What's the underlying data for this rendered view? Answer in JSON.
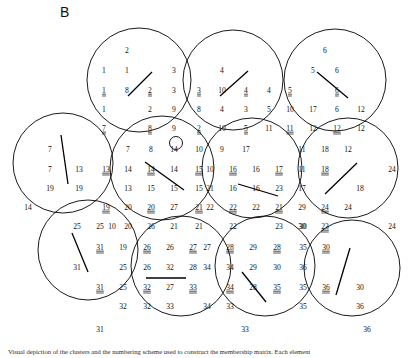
{
  "figure": {
    "panel_label": "B",
    "caption": "Visual depiction of the clusters and the numbering scheme used to construct the membership matrix. Each element",
    "stroke_color": "#000000",
    "background_color": "#ffffff"
  },
  "chart_data": {
    "type": "diagram",
    "title": "B",
    "grid_on": false,
    "legend": "none",
    "circles": [
      {
        "id": "c1",
        "cx": 139,
        "cy": 80,
        "r": 52,
        "segment": {
          "x1": 128,
          "y1": 96,
          "x2": 152,
          "y2": 72
        }
      },
      {
        "id": "c2",
        "cx": 233,
        "cy": 80,
        "r": 50,
        "segment": {
          "x1": 220,
          "y1": 96,
          "x2": 248,
          "y2": 71
        }
      },
      {
        "id": "c3",
        "cx": 335,
        "cy": 80,
        "r": 51,
        "segment": {
          "x1": 317,
          "y1": 72,
          "x2": 348,
          "y2": 98
        }
      },
      {
        "id": "c4",
        "cx": 63,
        "cy": 163,
        "r": 50,
        "segment": {
          "x1": 61,
          "y1": 135,
          "x2": 68,
          "y2": 184
        }
      },
      {
        "id": "c5",
        "cx": 162,
        "cy": 168,
        "r": 52,
        "segment": {
          "x1": 145,
          "y1": 162,
          "x2": 184,
          "y2": 190
        }
      },
      {
        "id": "c6",
        "cx": 252,
        "cy": 168,
        "r": 50,
        "segment": {
          "x1": 238,
          "y1": 184,
          "x2": 278,
          "y2": 196
        }
      },
      {
        "id": "c7",
        "cx": 348,
        "cy": 168,
        "r": 50,
        "segment": {
          "x1": 325,
          "y1": 194,
          "x2": 357,
          "y2": 163
        }
      },
      {
        "id": "c8",
        "cx": 88,
        "cy": 250,
        "r": 50,
        "segment": {
          "x1": 72,
          "y1": 233,
          "x2": 88,
          "y2": 272
        }
      },
      {
        "id": "c9",
        "cx": 181,
        "cy": 266,
        "r": 50,
        "segment": {
          "x1": 146,
          "y1": 278,
          "x2": 186,
          "y2": 278
        }
      },
      {
        "id": "c10",
        "cx": 265,
        "cy": 266,
        "r": 50,
        "segment": {
          "x1": 242,
          "y1": 272,
          "x2": 266,
          "y2": 302
        }
      },
      {
        "id": "c11",
        "cx": 352,
        "cy": 268,
        "r": 48,
        "segment": {
          "x1": 336,
          "y1": 295,
          "x2": 350,
          "y2": 248
        }
      }
    ],
    "marker": {
      "label": "9",
      "cx": 176,
      "cy": 143,
      "r": 6.5
    },
    "labels": [
      {
        "t": "2",
        "x": 127,
        "y": 51,
        "u": false
      },
      {
        "t": "1",
        "x": 104,
        "y": 71,
        "u": false
      },
      {
        "t": "1",
        "x": 127,
        "y": 71,
        "u": false
      },
      {
        "t": "3",
        "x": 174,
        "y": 71,
        "u": false
      },
      {
        "t": "1",
        "x": 104,
        "y": 91,
        "u": true
      },
      {
        "t": "8",
        "x": 127,
        "y": 91,
        "u": false
      },
      {
        "t": "2",
        "x": 150,
        "y": 91,
        "u": true
      },
      {
        "t": "3",
        "x": 174,
        "y": 91,
        "u": false
      },
      {
        "t": "1",
        "x": 104,
        "y": 110,
        "u": false
      },
      {
        "t": "2",
        "x": 150,
        "y": 110,
        "u": false
      },
      {
        "t": "9",
        "x": 174,
        "y": 110,
        "u": false
      },
      {
        "t": "7",
        "x": 104,
        "y": 129,
        "u": true
      },
      {
        "t": "8",
        "x": 150,
        "y": 129,
        "u": true
      },
      {
        "t": "9",
        "x": 174,
        "y": 129,
        "u": false
      },
      {
        "t": "4",
        "x": 222,
        "y": 71,
        "u": false
      },
      {
        "t": "3",
        "x": 199,
        "y": 91,
        "u": true
      },
      {
        "t": "10",
        "x": 222,
        "y": 91,
        "u": false
      },
      {
        "t": "4",
        "x": 246,
        "y": 91,
        "u": true
      },
      {
        "t": "4",
        "x": 269,
        "y": 91,
        "u": false
      },
      {
        "t": "8",
        "x": 199,
        "y": 110,
        "u": false
      },
      {
        "t": "4",
        "x": 222,
        "y": 110,
        "u": false
      },
      {
        "t": "3",
        "x": 246,
        "y": 110,
        "u": false
      },
      {
        "t": "5",
        "x": 269,
        "y": 110,
        "u": false
      },
      {
        "t": "2",
        "x": 199,
        "y": 129,
        "u": true
      },
      {
        "t": "10",
        "x": 222,
        "y": 129,
        "u": false
      },
      {
        "t": "5",
        "x": 246,
        "y": 129,
        "u": true
      },
      {
        "t": "11",
        "x": 269,
        "y": 129,
        "u": false
      },
      {
        "t": "6",
        "x": 325,
        "y": 51,
        "u": false
      },
      {
        "t": "5",
        "x": 313,
        "y": 71,
        "u": false
      },
      {
        "t": "6",
        "x": 337,
        "y": 71,
        "u": false
      },
      {
        "t": "5",
        "x": 290,
        "y": 91,
        "u": true
      },
      {
        "t": "6",
        "x": 337,
        "y": 91,
        "u": true
      },
      {
        "t": "10",
        "x": 290,
        "y": 110,
        "u": false
      },
      {
        "t": "17",
        "x": 313,
        "y": 110,
        "u": false
      },
      {
        "t": "6",
        "x": 337,
        "y": 110,
        "u": false
      },
      {
        "t": "12",
        "x": 361,
        "y": 110,
        "u": false
      },
      {
        "t": "11",
        "x": 290,
        "y": 129,
        "u": true
      },
      {
        "t": "12",
        "x": 313,
        "y": 129,
        "u": false
      },
      {
        "t": "12",
        "x": 337,
        "y": 129,
        "u": true
      },
      {
        "t": "12",
        "x": 361,
        "y": 129,
        "u": false
      },
      {
        "t": "7",
        "x": 50,
        "y": 150,
        "u": false
      },
      {
        "t": "7",
        "x": 50,
        "y": 170,
        "u": false
      },
      {
        "t": "13",
        "x": 79,
        "y": 170,
        "u": false
      },
      {
        "t": "19",
        "x": 50,
        "y": 189,
        "u": false
      },
      {
        "t": "19",
        "x": 79,
        "y": 189,
        "u": false
      },
      {
        "t": "14",
        "x": 28,
        "y": 208,
        "u": false
      },
      {
        "t": "19",
        "x": 106,
        "y": 208,
        "u": true
      },
      {
        "t": "13",
        "x": 106,
        "y": 170,
        "u": true
      },
      {
        "t": "7",
        "x": 128,
        "y": 150,
        "u": false
      },
      {
        "t": "8",
        "x": 151,
        "y": 150,
        "u": false
      },
      {
        "t": "14",
        "x": 174,
        "y": 150,
        "u": false
      },
      {
        "t": "14",
        "x": 128,
        "y": 170,
        "u": false
      },
      {
        "t": "14",
        "x": 151,
        "y": 170,
        "u": true
      },
      {
        "t": "14",
        "x": 174,
        "y": 170,
        "u": false
      },
      {
        "t": "13",
        "x": 128,
        "y": 189,
        "u": false
      },
      {
        "t": "15",
        "x": 151,
        "y": 189,
        "u": false
      },
      {
        "t": "15",
        "x": 174,
        "y": 189,
        "u": false
      },
      {
        "t": "20",
        "x": 128,
        "y": 208,
        "u": false
      },
      {
        "t": "20",
        "x": 151,
        "y": 208,
        "u": true
      },
      {
        "t": "27",
        "x": 174,
        "y": 208,
        "u": false
      },
      {
        "t": "20",
        "x": 128,
        "y": 227,
        "u": false
      },
      {
        "t": "26",
        "x": 151,
        "y": 227,
        "u": false
      },
      {
        "t": "21",
        "x": 174,
        "y": 227,
        "u": false
      },
      {
        "t": "10",
        "x": 199,
        "y": 150,
        "u": false
      },
      {
        "t": "9",
        "x": 222,
        "y": 150,
        "u": false
      },
      {
        "t": "17",
        "x": 246,
        "y": 150,
        "u": false
      },
      {
        "t": "15",
        "x": 199,
        "y": 170,
        "u": true
      },
      {
        "t": "10",
        "x": 210,
        "y": 170,
        "u": false
      },
      {
        "t": "16",
        "x": 233,
        "y": 170,
        "u": true
      },
      {
        "t": "16",
        "x": 256,
        "y": 170,
        "u": false
      },
      {
        "t": "17",
        "x": 279,
        "y": 170,
        "u": true
      },
      {
        "t": "15",
        "x": 199,
        "y": 189,
        "u": false
      },
      {
        "t": "21",
        "x": 210,
        "y": 189,
        "u": false
      },
      {
        "t": "16",
        "x": 233,
        "y": 189,
        "u": false
      },
      {
        "t": "16",
        "x": 256,
        "y": 189,
        "u": false
      },
      {
        "t": "23",
        "x": 279,
        "y": 189,
        "u": false
      },
      {
        "t": "21",
        "x": 199,
        "y": 208,
        "u": true
      },
      {
        "t": "22",
        "x": 210,
        "y": 208,
        "u": false
      },
      {
        "t": "22",
        "x": 233,
        "y": 208,
        "u": true
      },
      {
        "t": "22",
        "x": 256,
        "y": 208,
        "u": false
      },
      {
        "t": "21",
        "x": 279,
        "y": 208,
        "u": true
      },
      {
        "t": "21",
        "x": 199,
        "y": 227,
        "u": false
      },
      {
        "t": "22",
        "x": 233,
        "y": 227,
        "u": false
      },
      {
        "t": "23",
        "x": 279,
        "y": 227,
        "u": false
      },
      {
        "t": "11",
        "x": 302,
        "y": 150,
        "u": false
      },
      {
        "t": "18",
        "x": 325,
        "y": 150,
        "u": false
      },
      {
        "t": "12",
        "x": 348,
        "y": 150,
        "u": false
      },
      {
        "t": "11",
        "x": 302,
        "y": 170,
        "u": false
      },
      {
        "t": "18",
        "x": 325,
        "y": 170,
        "u": true
      },
      {
        "t": "24",
        "x": 392,
        "y": 170,
        "u": false
      },
      {
        "t": "17",
        "x": 302,
        "y": 189,
        "u": false
      },
      {
        "t": "18",
        "x": 360,
        "y": 189,
        "u": false
      },
      {
        "t": "29",
        "x": 302,
        "y": 208,
        "u": false
      },
      {
        "t": "24",
        "x": 325,
        "y": 208,
        "u": true
      },
      {
        "t": "24",
        "x": 348,
        "y": 208,
        "u": false
      },
      {
        "t": "30",
        "x": 302,
        "y": 227,
        "u": false
      },
      {
        "t": "23",
        "x": 325,
        "y": 227,
        "u": true
      },
      {
        "t": "24",
        "x": 392,
        "y": 227,
        "u": false
      },
      {
        "t": "25",
        "x": 77,
        "y": 227,
        "u": false
      },
      {
        "t": "25",
        "x": 100,
        "y": 227,
        "u": false
      },
      {
        "t": "31",
        "x": 100,
        "y": 248,
        "u": true
      },
      {
        "t": "31",
        "x": 77,
        "y": 268,
        "u": false
      },
      {
        "t": "31",
        "x": 100,
        "y": 288,
        "u": true
      },
      {
        "t": "10",
        "x": 112,
        "y": 227,
        "u": false
      },
      {
        "t": "19",
        "x": 123,
        "y": 248,
        "u": false
      },
      {
        "t": "26",
        "x": 147,
        "y": 248,
        "u": true
      },
      {
        "t": "26",
        "x": 170,
        "y": 248,
        "u": false
      },
      {
        "t": "27",
        "x": 193,
        "y": 248,
        "u": true
      },
      {
        "t": "25",
        "x": 123,
        "y": 268,
        "u": false
      },
      {
        "t": "26",
        "x": 147,
        "y": 268,
        "u": false
      },
      {
        "t": "32",
        "x": 170,
        "y": 268,
        "u": false
      },
      {
        "t": "28",
        "x": 193,
        "y": 268,
        "u": false
      },
      {
        "t": "25",
        "x": 123,
        "y": 288,
        "u": false
      },
      {
        "t": "32",
        "x": 147,
        "y": 288,
        "u": true
      },
      {
        "t": "27",
        "x": 170,
        "y": 288,
        "u": false
      },
      {
        "t": "33",
        "x": 193,
        "y": 288,
        "u": true
      },
      {
        "t": "32",
        "x": 123,
        "y": 307,
        "u": false
      },
      {
        "t": "32",
        "x": 147,
        "y": 307,
        "u": false
      },
      {
        "t": "33",
        "x": 170,
        "y": 307,
        "u": false
      },
      {
        "t": "31",
        "x": 100,
        "y": 330,
        "u": false
      },
      {
        "t": "27",
        "x": 207,
        "y": 248,
        "u": false
      },
      {
        "t": "28",
        "x": 230,
        "y": 248,
        "u": true
      },
      {
        "t": "29",
        "x": 253,
        "y": 248,
        "u": false
      },
      {
        "t": "28",
        "x": 277,
        "y": 248,
        "u": true
      },
      {
        "t": "34",
        "x": 207,
        "y": 268,
        "u": false
      },
      {
        "t": "34",
        "x": 230,
        "y": 268,
        "u": false
      },
      {
        "t": "29",
        "x": 253,
        "y": 268,
        "u": false
      },
      {
        "t": "30",
        "x": 277,
        "y": 268,
        "u": false
      },
      {
        "t": "34",
        "x": 230,
        "y": 288,
        "u": true
      },
      {
        "t": "28",
        "x": 253,
        "y": 288,
        "u": false
      },
      {
        "t": "35",
        "x": 277,
        "y": 288,
        "u": true
      },
      {
        "t": "34",
        "x": 207,
        "y": 307,
        "u": false
      },
      {
        "t": "33",
        "x": 230,
        "y": 307,
        "u": false
      },
      {
        "t": "33",
        "x": 245,
        "y": 330,
        "u": false
      },
      {
        "t": "30",
        "x": 303,
        "y": 227,
        "u": false
      },
      {
        "t": "35",
        "x": 303,
        "y": 248,
        "u": false
      },
      {
        "t": "30",
        "x": 326,
        "y": 248,
        "u": true
      },
      {
        "t": "36",
        "x": 303,
        "y": 268,
        "u": false
      },
      {
        "t": "35",
        "x": 303,
        "y": 288,
        "u": false
      },
      {
        "t": "36",
        "x": 326,
        "y": 288,
        "u": true
      },
      {
        "t": "30",
        "x": 360,
        "y": 288,
        "u": false
      },
      {
        "t": "35",
        "x": 303,
        "y": 307,
        "u": false
      },
      {
        "t": "36",
        "x": 360,
        "y": 307,
        "u": false
      },
      {
        "t": "36",
        "x": 367,
        "y": 330,
        "u": false
      }
    ]
  }
}
